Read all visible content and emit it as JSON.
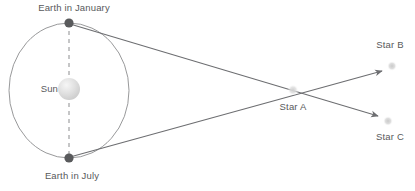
{
  "diagram": {
    "background_color": "#ffffff",
    "line_color": "#6d6e71",
    "label_color": "#58595b",
    "orbit": {
      "name": "earth-orbit",
      "center_x": 69,
      "center_y": 90.5,
      "radius_x": 60,
      "radius_y": 67.5,
      "stroke_color": "#8c8d8f",
      "stroke_width": 0.9
    },
    "sun": {
      "label": "Sun",
      "center_x": 69,
      "center_y": 89,
      "radius": 11,
      "fill_color": "#d4d4d4",
      "highlight_color": "#f2f2f2",
      "label_x": 44,
      "label_y": 92
    },
    "axis": {
      "name": "orbit-axis",
      "x": 69,
      "y1": 23,
      "y2": 158,
      "stroke_color": "#8c8d8f",
      "dash": "4,4"
    },
    "earth_positions": [
      {
        "key": "january",
        "label": "Earth in January",
        "dot_x": 69,
        "dot_y": 23,
        "dot_radius": 4.6,
        "dot_color": "#595a5c",
        "label_x": 74,
        "label_y": 11,
        "label_anchor": "middle"
      },
      {
        "key": "july",
        "label": "Earth in July",
        "dot_x": 69,
        "dot_y": 158,
        "dot_radius": 4.6,
        "dot_color": "#595a5c",
        "label_x": 72,
        "label_y": 179,
        "label_anchor": "middle"
      }
    ],
    "stars": [
      {
        "key": "star_a",
        "label": "Star A",
        "dot_x": 293,
        "dot_y": 90,
        "dot_radius": 5.5,
        "dot_color": "#d9d9d9",
        "label_x": 293,
        "label_y": 110,
        "label_anchor": "middle"
      },
      {
        "key": "star_b",
        "label": "Star B",
        "dot_x": 392,
        "dot_y": 66,
        "dot_radius": 5,
        "dot_color": "#d2d2d2",
        "label_x": 390,
        "label_y": 48,
        "label_anchor": "middle"
      },
      {
        "key": "star_c",
        "label": "Star C",
        "dot_x": 388,
        "dot_y": 121,
        "dot_radius": 5,
        "dot_color": "#d2d2d2",
        "label_x": 390,
        "label_y": 140,
        "label_anchor": "middle"
      }
    ],
    "sight_lines": [
      {
        "key": "january-to-star-c",
        "from": "Earth in January",
        "through": "Star A",
        "to": "Star C",
        "x1": 70,
        "y1": 24,
        "x2": 378,
        "y2": 116,
        "stroke_color": "#6d6e71",
        "stroke_width": 1.1,
        "arrow": true
      },
      {
        "key": "july-to-star-b",
        "from": "Earth in July",
        "through": "Star A",
        "to": "Star B",
        "x1": 70,
        "y1": 157,
        "x2": 382,
        "y2": 71,
        "stroke_color": "#6d6e71",
        "stroke_width": 1.1,
        "arrow": true
      }
    ]
  }
}
